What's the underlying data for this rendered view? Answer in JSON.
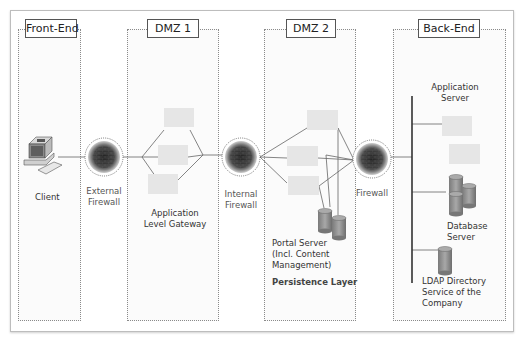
{
  "zones": [
    {
      "id": "front-end",
      "title": "Front-End"
    },
    {
      "id": "dmz1",
      "title": "DMZ 1"
    },
    {
      "id": "dmz2",
      "title": "DMZ 2"
    },
    {
      "id": "back-end",
      "title": "Back-End"
    }
  ],
  "nodes": {
    "client": "Client",
    "external_firewall": [
      "External",
      "Firewall"
    ],
    "application_level_gateway": [
      "Application",
      "Level  Gateway"
    ],
    "internal_firewall": [
      "Internal",
      "Firewall"
    ],
    "firewall": "Firewall",
    "portal_server": [
      "Portal Server",
      "(Incl. Content",
      "Management)"
    ],
    "persistence_layer": "Persistence Layer",
    "application_server": [
      "Application",
      "Server"
    ],
    "database_server": [
      "Database",
      "Server"
    ],
    "ldap": [
      "LDAP Directory",
      "Service of the",
      "Company"
    ]
  },
  "colors": {
    "zone_border": "#8a8a8a",
    "server_box": "#e6e6e6",
    "line": "#666666",
    "bus": "#333333",
    "cylinder": "#8f8f8f"
  }
}
